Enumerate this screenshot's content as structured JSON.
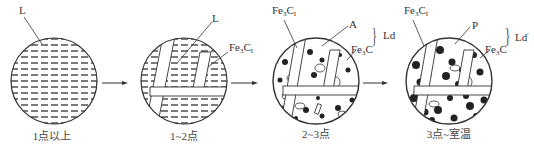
{
  "diagram": {
    "type": "microstructure-evolution",
    "stages": [
      {
        "id": 1,
        "caption": "1点以上",
        "phases": [
          "L"
        ]
      },
      {
        "id": 2,
        "caption": "1~2点",
        "phases": [
          "L",
          "Fe3CI"
        ]
      },
      {
        "id": 3,
        "caption": "2~3点",
        "phases": [
          "Fe3CI",
          "A",
          "Fe3C"
        ],
        "group_label": "Ld"
      },
      {
        "id": 4,
        "caption": "3点~室温",
        "phases": [
          "Fe3CI",
          "P",
          "Fe3C"
        ],
        "group_label": "Ld'"
      }
    ],
    "labels": {
      "L1": "L",
      "L2": "L",
      "fe3c_base": "Fe",
      "fe3c_sub3": "3",
      "c": "C",
      "primary_sub": "I",
      "A": "A",
      "P": "P",
      "Ld": "Ld",
      "Ld_prime": "Ld",
      "prime": "′",
      "brace": "}"
    },
    "arrows": [
      "stage1-to-stage2",
      "stage2-to-stage3",
      "stage3-to-stage4"
    ],
    "colors": {
      "line": "#333333",
      "fill_dark": "#222222",
      "background": "#ffffff"
    }
  }
}
